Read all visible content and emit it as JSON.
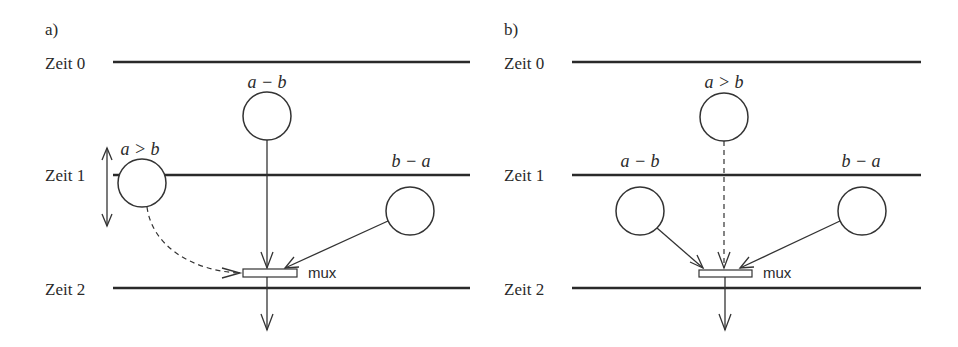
{
  "panel_a": {
    "label": "a)",
    "time_labels": [
      "Zeit 0",
      "Zeit 1",
      "Zeit 2"
    ],
    "nodes": {
      "top": "a − b",
      "left": "a > b",
      "right": "b − a"
    },
    "mux_label": "mux"
  },
  "panel_b": {
    "label": "b)",
    "time_labels": [
      "Zeit 0",
      "Zeit 1",
      "Zeit 2"
    ],
    "nodes": {
      "top": "a > b",
      "left": "a − b",
      "right": "b − a"
    },
    "mux_label": "mux"
  },
  "colors": {
    "line": "#2a2a2a",
    "background": "#ffffff"
  }
}
